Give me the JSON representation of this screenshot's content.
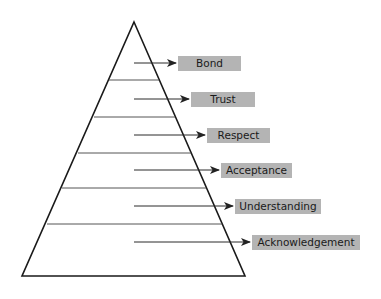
{
  "diagram": {
    "type": "pyramid",
    "colors": {
      "outline": "#1a1a1a",
      "divider": "#555555",
      "arrow": "#2a2a2a",
      "label_bg": "#b4b4b4",
      "label_text": "#1a1a1a"
    },
    "levels_top_to_bottom": [
      {
        "label": "Bond"
      },
      {
        "label": "Trust"
      },
      {
        "label": "Respect"
      },
      {
        "label": "Acceptance"
      },
      {
        "label": "Understanding"
      },
      {
        "label": "Acknowledgement"
      }
    ]
  }
}
